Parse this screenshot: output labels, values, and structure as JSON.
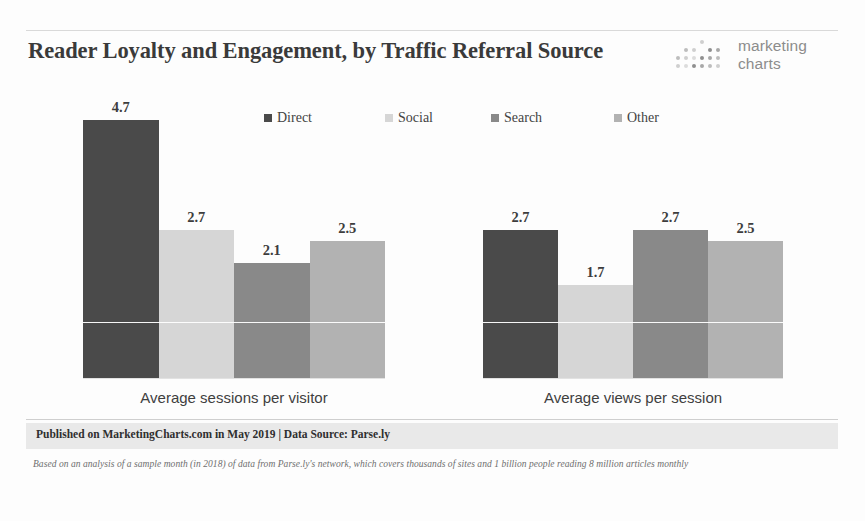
{
  "header": {
    "title": "Reader Loyalty and Engagement, by Traffic Referral Source",
    "logo": {
      "line1": "marketing",
      "line2": "charts",
      "dots_icon": "dot-grid-icon"
    }
  },
  "footer": {
    "published": "Published on MarketingCharts.com in May 2019 | Data Source: Parse.ly",
    "note": "Based on an analysis of a sample month (in 2018) of data from Parse.ly's network, which covers thousands of sites and 1 billion people reading 8 million articles monthly"
  },
  "colors": {
    "direct": "#4a4a4a",
    "social": "#d6d6d6",
    "search": "#898989",
    "other": "#b2b2b2",
    "gridline": "#ffffff",
    "footer_band": "#e9e9e9",
    "text": "#3a3a3a"
  },
  "chart_data": {
    "type": "bar",
    "title": "Reader Loyalty and Engagement, by Traffic Referral Source",
    "xlabel": "",
    "ylabel": "",
    "ylim": [
      0,
      5.2
    ],
    "grid": true,
    "gridlines": [
      1.0
    ],
    "legend_position": "top-center",
    "categories": [
      "Average sessions per visitor",
      "Average views per session"
    ],
    "series": [
      {
        "name": "Direct",
        "color": "#4a4a4a",
        "values": [
          4.7,
          2.7
        ]
      },
      {
        "name": "Social",
        "color": "#d6d6d6",
        "values": [
          2.7,
          1.7
        ]
      },
      {
        "name": "Search",
        "color": "#898989",
        "values": [
          2.1,
          2.7
        ]
      },
      {
        "name": "Other",
        "color": "#b2b2b2",
        "values": [
          2.5,
          2.5
        ]
      }
    ],
    "value_labels": [
      [
        "4.7",
        "2.7",
        "2.1",
        "2.5"
      ],
      [
        "2.7",
        "1.7",
        "2.7",
        "2.5"
      ]
    ]
  }
}
